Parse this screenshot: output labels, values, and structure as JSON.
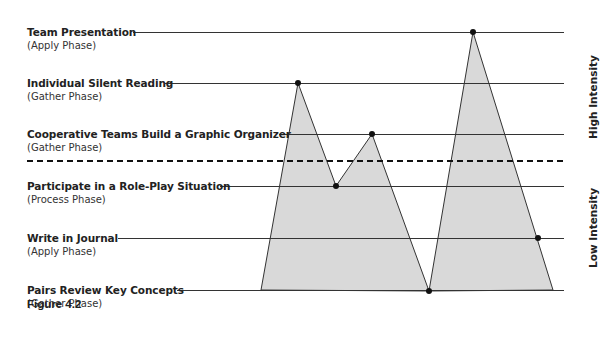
{
  "figure_label": "Figure 4.2",
  "activities": [
    {
      "title": "Team Presentation",
      "phase": "(Apply Phase)",
      "y": 32,
      "line_start": 133
    },
    {
      "title": "Individual Silent Reading",
      "phase": "(Gather Phase)",
      "y": 83,
      "line_start": 165
    },
    {
      "title": "Cooperative Teams Build a Graphic Organizer",
      "phase": "(Gather Phase)",
      "y": 134,
      "line_start": 279
    },
    {
      "title": "Participate in a Role-Play Situation",
      "phase": "(Process Phase)",
      "y": 186,
      "line_start": 220
    },
    {
      "title": "Write in Journal",
      "phase": "(Apply Phase)",
      "y": 238,
      "line_start": 118
    },
    {
      "title": "Pairs Review Key Concepts",
      "phase": "(Gather Phase)",
      "y": 290,
      "line_start": 177
    }
  ],
  "intensity_labels": {
    "high": "High Intensity",
    "low": "Low Intensity"
  },
  "divider_y": 161,
  "line_end_x": 564,
  "colors": {
    "fill": "#d9d9d9",
    "line": "#333333",
    "dot": "#111111"
  },
  "sequence_points": [
    {
      "activity": "Individual Silent Reading",
      "x": 298,
      "y": 83
    },
    {
      "activity": "Participate in a Role-Play Situation",
      "x": 336,
      "y": 186
    },
    {
      "activity": "Cooperative Teams Build a Graphic Organizer",
      "x": 372,
      "y": 134
    },
    {
      "activity": "Pairs Review Key Concepts",
      "x": 429,
      "y": 291
    },
    {
      "activity": "Team Presentation",
      "x": 473,
      "y": 32
    },
    {
      "activity": "Write in Journal",
      "x": 538,
      "y": 238
    }
  ]
}
